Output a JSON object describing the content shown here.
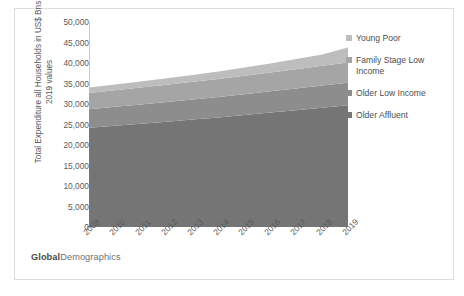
{
  "chart_data": {
    "type": "area",
    "stacked": true,
    "title": "",
    "xlabel": "",
    "ylabel": "Total Expenditure all Households in US$ Bns 2019 values",
    "ylabel_lines": [
      "Total Expenditure all Households in US$ Bns",
      "2019 values"
    ],
    "categories": [
      "2009",
      "2010",
      "2011",
      "2012",
      "2013",
      "2014",
      "2015",
      "2016",
      "2017",
      "2018",
      "2019"
    ],
    "ylim": [
      0,
      50000
    ],
    "ytick_labels": [
      "0",
      "5,000",
      "10,000",
      "15,000",
      "20,000",
      "25,000",
      "30,000",
      "35,000",
      "40,000",
      "45,000",
      "50,000"
    ],
    "ytick_values": [
      0,
      5000,
      10000,
      15000,
      20000,
      25000,
      30000,
      35000,
      40000,
      45000,
      50000
    ],
    "grid": false,
    "legend_position": "right",
    "series": [
      {
        "name": "Older Affluent",
        "color": "#757575",
        "values": [
          24200,
          24700,
          25200,
          25700,
          26200,
          26700,
          27300,
          27900,
          28500,
          29100,
          29700
        ]
      },
      {
        "name": "Older Low Income",
        "color": "#8d8d8d",
        "values": [
          4500,
          4600,
          4700,
          4800,
          4900,
          5000,
          5100,
          5200,
          5300,
          5400,
          5500
        ]
      },
      {
        "name": "Family Stage Low Income",
        "color": "#a5a5a5",
        "values": [
          4000,
          4050,
          4100,
          4200,
          4300,
          4400,
          4500,
          4600,
          4700,
          4800,
          4900
        ]
      },
      {
        "name": "Young Poor",
        "color": "#bdbdbd",
        "values": [
          1300,
          1400,
          1500,
          1600,
          1700,
          1800,
          2000,
          2200,
          2500,
          2800,
          3700
        ]
      }
    ]
  },
  "legend": {
    "items": [
      {
        "label": "Young Poor",
        "color": "#bdbdbd"
      },
      {
        "label": "Family Stage Low Income",
        "color": "#a5a5a5"
      },
      {
        "label": "Older Low Income",
        "color": "#8d8d8d"
      },
      {
        "label": "Older Affluent",
        "color": "#757575"
      }
    ]
  },
  "watermark": {
    "bold_text": "Global",
    "light_text": "Demographics"
  }
}
